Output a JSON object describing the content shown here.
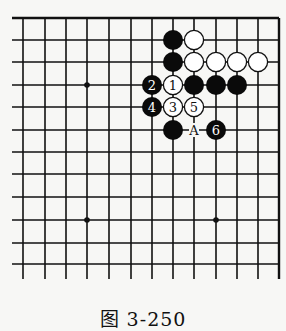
{
  "figure": {
    "caption": "图 3-250",
    "colors": {
      "line": "#111111",
      "black_stone": "#0a0a0a",
      "white_stone": "#ffffff",
      "background": "#f7f7f5"
    }
  },
  "board": {
    "columns_x": [
      23,
      45,
      66,
      87,
      109,
      131,
      152,
      173,
      194,
      216,
      237,
      258,
      279
    ],
    "rows_y": [
      18,
      40,
      62,
      85,
      107,
      130,
      152,
      174,
      197,
      220,
      243,
      264
    ],
    "edges": {
      "top": "closed",
      "right": "closed",
      "left": "open",
      "bottom": "open"
    },
    "star_points": [
      {
        "col": 3,
        "row": 3
      },
      {
        "col": 3,
        "row": 9
      },
      {
        "col": 9,
        "row": 9
      }
    ],
    "stones": [
      {
        "col": 7,
        "row": 1,
        "color": "black",
        "label": ""
      },
      {
        "col": 8,
        "row": 1,
        "color": "white",
        "label": ""
      },
      {
        "col": 7,
        "row": 2,
        "color": "black",
        "label": ""
      },
      {
        "col": 8,
        "row": 2,
        "color": "white",
        "label": ""
      },
      {
        "col": 9,
        "row": 2,
        "color": "white",
        "label": ""
      },
      {
        "col": 10,
        "row": 2,
        "color": "white",
        "label": ""
      },
      {
        "col": 11,
        "row": 2,
        "color": "white",
        "label": ""
      },
      {
        "col": 6,
        "row": 3,
        "color": "black",
        "label": "2"
      },
      {
        "col": 7,
        "row": 3,
        "color": "white",
        "label": "1"
      },
      {
        "col": 8,
        "row": 3,
        "color": "black",
        "label": ""
      },
      {
        "col": 9,
        "row": 3,
        "color": "black",
        "label": ""
      },
      {
        "col": 10,
        "row": 3,
        "color": "black",
        "label": ""
      },
      {
        "col": 6,
        "row": 4,
        "color": "black",
        "label": "4"
      },
      {
        "col": 7,
        "row": 4,
        "color": "white",
        "label": "3"
      },
      {
        "col": 8,
        "row": 4,
        "color": "white",
        "label": "5"
      },
      {
        "col": 7,
        "row": 5,
        "color": "black",
        "label": ""
      },
      {
        "col": 9,
        "row": 5,
        "color": "black",
        "label": "6"
      }
    ],
    "markers": [
      {
        "col": 8,
        "row": 5,
        "label": "A"
      }
    ]
  }
}
